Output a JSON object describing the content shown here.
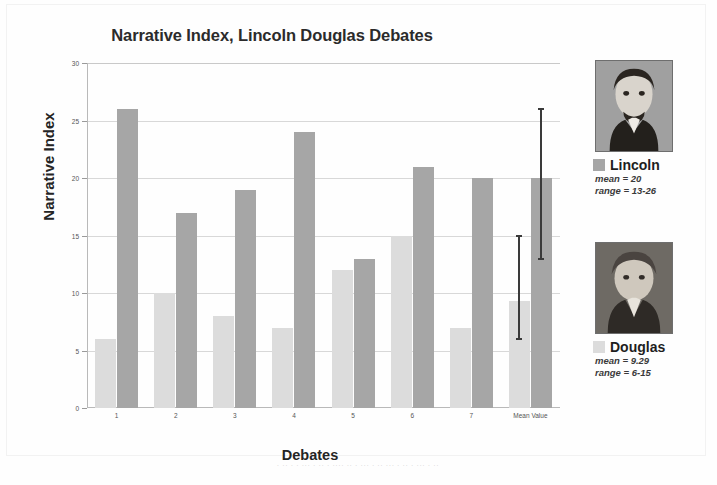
{
  "chart_data": {
    "type": "bar",
    "title": "Narrative Index, Lincoln Douglas Debates",
    "xlabel": "Debates",
    "ylabel": "Narrative Index",
    "ylim": [
      0,
      30
    ],
    "yticks": [
      0,
      5,
      10,
      15,
      20,
      25,
      30
    ],
    "grid": true,
    "legend_position": "right",
    "categories": [
      "1",
      "2",
      "3",
      "4",
      "5",
      "6",
      "7",
      "Mean Value"
    ],
    "series": [
      {
        "name": "Douglas",
        "color": "#dcdcdc",
        "values": [
          6,
          10,
          8,
          7,
          12,
          15,
          7,
          9.29
        ],
        "error_bar": {
          "category": "Mean Value",
          "low": 6,
          "high": 15
        }
      },
      {
        "name": "Lincoln",
        "color": "#a6a6a6",
        "values": [
          26,
          17,
          19,
          24,
          13,
          21,
          20,
          20
        ],
        "error_bar": {
          "category": "Mean Value",
          "low": 13,
          "high": 26
        }
      }
    ],
    "annotations": [
      {
        "text": "mean = 20",
        "series": "Lincoln"
      },
      {
        "text": "range = 13-26",
        "series": "Lincoln"
      },
      {
        "text": "mean = 9.29",
        "series": "Douglas"
      },
      {
        "text": "range = 6-15",
        "series": "Douglas"
      }
    ]
  },
  "legend": {
    "entries": [
      {
        "name": "Lincoln",
        "swatch_color": "#a6a6a6",
        "mean_label": "mean = 20",
        "range_label": "range = 13-26",
        "portrait_name": "lincoln-portrait"
      },
      {
        "name": "Douglas",
        "swatch_color": "#dcdcdc",
        "mean_label": "mean = 9.29",
        "range_label": "range = 6-15",
        "portrait_name": "douglas-portrait"
      }
    ]
  },
  "caption": {
    "text": "· ·· · · ··· · ·· · ···· ·· · ··· · ·· ··· · ·· · ··· · ··"
  }
}
